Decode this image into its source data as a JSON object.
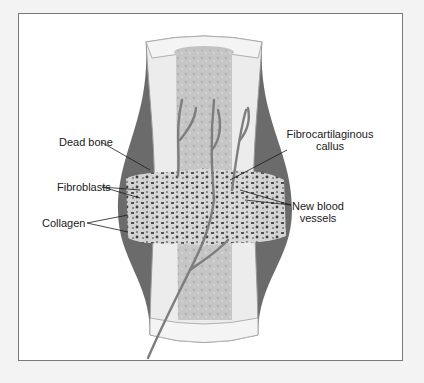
{
  "figure": {
    "labels": {
      "dead_bone": "Dead bone",
      "fibroblasts": "Fibroblasts",
      "collagen": "Collagen",
      "fibrocartilaginous_callus_line1": "Fibrocartilaginous",
      "fibrocartilaginous_callus_line2": "callus",
      "new_blood_vessels_line1": "New blood",
      "new_blood_vessels_line2": "vessels"
    },
    "colors": {
      "page_background": "#f3f3f3",
      "frame_border": "#7a7a7a",
      "bone_outer": "#ececec",
      "marrow": "#c9c9c9",
      "periosteum": "#6b6b6b",
      "vessel": "#8a8a8a",
      "text": "#1a1a1a"
    }
  }
}
